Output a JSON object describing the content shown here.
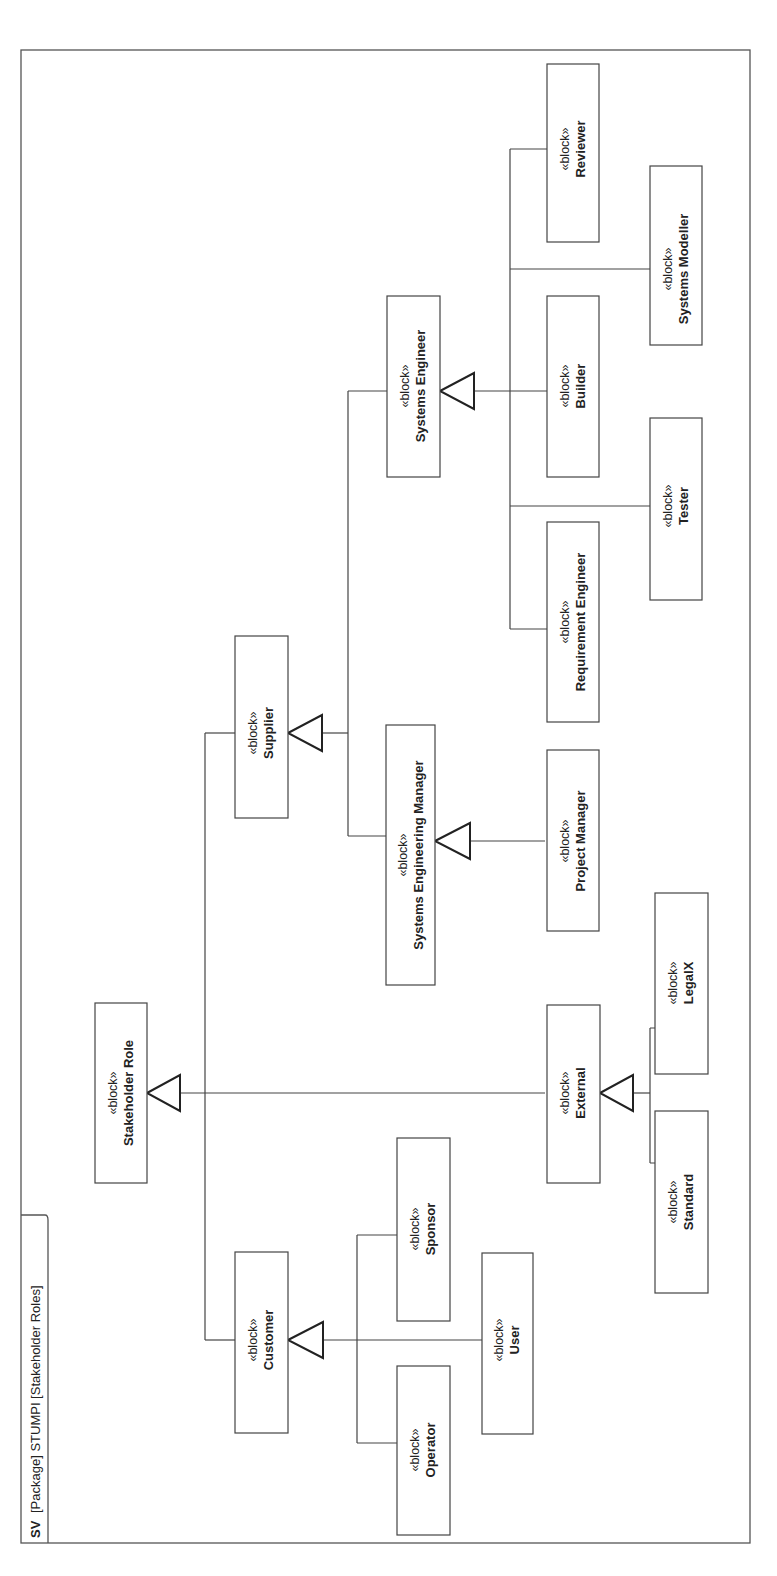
{
  "frame": {
    "kind": "SV",
    "title": "[Package] STUMPI [Stakeholder Roles]"
  },
  "stereotype": "«block»",
  "blocks": {
    "stakeholder_role": "Stakeholder Role",
    "customer": "Customer",
    "supplier": "Supplier",
    "external": "External",
    "operator": "Operator",
    "sponsor": "Sponsor",
    "user": "User",
    "standard": "Standard",
    "legalx": "LegalX",
    "systems_engineering_manager": "Systems Engineering Manager",
    "project_manager": "Project Manager",
    "systems_engineer": "Systems Engineer",
    "requirement_engineer": "Requirement Engineer",
    "tester": "Tester",
    "builder": "Builder",
    "systems_modeller": "Systems Modeller",
    "reviewer": "Reviewer"
  },
  "generalizations": [
    {
      "child": "Customer",
      "parent": "Stakeholder Role"
    },
    {
      "child": "Supplier",
      "parent": "Stakeholder Role"
    },
    {
      "child": "External",
      "parent": "Stakeholder Role"
    },
    {
      "child": "Operator",
      "parent": "Customer"
    },
    {
      "child": "Sponsor",
      "parent": "Customer"
    },
    {
      "child": "User",
      "parent": "Customer"
    },
    {
      "child": "Standard",
      "parent": "External"
    },
    {
      "child": "LegalX",
      "parent": "External"
    },
    {
      "child": "Systems Engineering Manager",
      "parent": "Supplier"
    },
    {
      "child": "Systems Engineer",
      "parent": "Supplier"
    },
    {
      "child": "Project Manager",
      "parent": "Systems Engineering Manager"
    },
    {
      "child": "Requirement Engineer",
      "parent": "Systems Engineer"
    },
    {
      "child": "Tester",
      "parent": "Systems Engineer"
    },
    {
      "child": "Builder",
      "parent": "Systems Engineer"
    },
    {
      "child": "Systems Modeller",
      "parent": "Systems Engineer"
    },
    {
      "child": "Reviewer",
      "parent": "Systems Engineer"
    }
  ]
}
